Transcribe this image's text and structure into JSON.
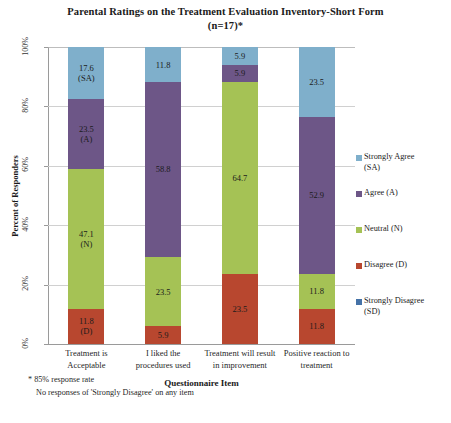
{
  "chart_data": {
    "type": "bar",
    "subtype": "stacked-100-percent",
    "title": "Parental Ratings on the Treatment Evaluation Inventory-Short Form (n=17)*",
    "title_lines": [
      "Parental Ratings on the Treatment Evaluation Inventory-Short Form",
      "(n=17)*"
    ],
    "xlabel": "Questionnaire Item",
    "ylabel": "Percent of Responders",
    "ylim": [
      0,
      100
    ],
    "yticks": [
      "0%",
      "20%",
      "40%",
      "60%",
      "80%",
      "100%"
    ],
    "ytick_values": [
      0,
      20,
      40,
      60,
      80,
      100
    ],
    "grid": true,
    "legend_position": "right",
    "categories": [
      "Treatment is Acceptable",
      "I liked the procedures used",
      "Treatment will result in improvement",
      "Positive reaction to treatment"
    ],
    "category_lines": [
      [
        "Treatment is",
        "Acceptable"
      ],
      [
        "I liked the",
        "procedures used"
      ],
      [
        "Treatment will result",
        "in improvement"
      ],
      [
        "Positive reaction to",
        "treatment"
      ]
    ],
    "series": [
      {
        "name": "Strongly Agree (SA)",
        "short": "SA",
        "color": "#7FAFCB",
        "values": [
          17.6,
          11.8,
          5.9,
          23.5
        ]
      },
      {
        "name": "Agree (A)",
        "short": "A",
        "color": "#6D5687",
        "values": [
          23.5,
          58.8,
          5.9,
          52.9
        ]
      },
      {
        "name": "Neutral (N)",
        "short": "N",
        "color": "#A5C255",
        "values": [
          47.1,
          23.5,
          64.7,
          11.8
        ]
      },
      {
        "name": "Disagree (D)",
        "short": "D",
        "color": "#B8472F",
        "values": [
          11.8,
          5.9,
          23.5,
          11.8
        ]
      },
      {
        "name": "Strongly Disagree (SD)",
        "short": "SD",
        "color": "#4572A7",
        "values": [
          0,
          0,
          0,
          0
        ]
      }
    ],
    "bar_labels": [
      [
        {
          "value": "17.6",
          "key": "(SA)"
        },
        {
          "value": "23.5",
          "key": "(A)"
        },
        {
          "value": "47.1",
          "key": "(N)"
        },
        {
          "value": "11.8",
          "key": "(D)"
        }
      ],
      [
        {
          "value": "11.8",
          "key": ""
        },
        {
          "value": "58.8",
          "key": ""
        },
        {
          "value": "23.5",
          "key": ""
        },
        {
          "value": "5.9",
          "key": ""
        }
      ],
      [
        {
          "value": "5.9",
          "key": ""
        },
        {
          "value": "5.9",
          "key": ""
        },
        {
          "value": "64.7",
          "key": ""
        },
        {
          "value": "23.5",
          "key": ""
        }
      ],
      [
        {
          "value": "23.5",
          "key": ""
        },
        {
          "value": "52.9",
          "key": ""
        },
        {
          "value": "11.8",
          "key": ""
        },
        {
          "value": "11.8",
          "key": ""
        }
      ]
    ],
    "legend_entries": [
      {
        "label": "Strongly Agree\n(SA)",
        "color": "#7FAFCB"
      },
      {
        "label": "Agree (A)",
        "color": "#6D5687"
      },
      {
        "label": "Neutral (N)",
        "color": "#A5C255"
      },
      {
        "label": "Disagree (D)",
        "color": "#B8472F"
      },
      {
        "label": "Strongly Disagree\n(SD)",
        "color": "#4572A7"
      }
    ],
    "annotations": [
      "* 85% response rate",
      "No responses of 'Strongly Disagree' on any item"
    ]
  }
}
